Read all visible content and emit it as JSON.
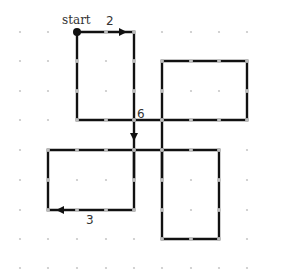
{
  "diagram": {
    "type": "grid-path",
    "colors": {
      "background": "#ffffff",
      "grid_dot": "#c8c8c8",
      "path": "#111111",
      "path_dot": "#bdbdbd",
      "label": "#333333"
    },
    "grid": {
      "columns_x": [
        20,
        48,
        77,
        106,
        134,
        162,
        191,
        219,
        247
      ],
      "rows_y": [
        32,
        61,
        91,
        120,
        150,
        180,
        210,
        239,
        268
      ]
    },
    "start_point": {
      "col": 2,
      "row": 0
    },
    "segments": [
      [
        [
          2,
          0
        ],
        [
          4,
          0
        ]
      ],
      [
        [
          2,
          0
        ],
        [
          2,
          3
        ]
      ],
      [
        [
          4,
          0
        ],
        [
          4,
          3
        ]
      ],
      [
        [
          2,
          3
        ],
        [
          4,
          3
        ]
      ],
      [
        [
          5,
          1
        ],
        [
          8,
          1
        ]
      ],
      [
        [
          5,
          1
        ],
        [
          5,
          3
        ]
      ],
      [
        [
          8,
          1
        ],
        [
          8,
          3
        ]
      ],
      [
        [
          4,
          3
        ],
        [
          8,
          3
        ]
      ],
      [
        [
          4,
          3
        ],
        [
          4,
          5
        ]
      ],
      [
        [
          5,
          3
        ],
        [
          5,
          5
        ]
      ],
      [
        [
          1,
          4
        ],
        [
          5,
          4
        ]
      ],
      [
        [
          1,
          4
        ],
        [
          1,
          6
        ]
      ],
      [
        [
          4,
          4
        ],
        [
          4,
          6
        ]
      ],
      [
        [
          1,
          6
        ],
        [
          4,
          6
        ]
      ],
      [
        [
          5,
          4
        ],
        [
          7,
          4
        ]
      ],
      [
        [
          5,
          4
        ],
        [
          5,
          7
        ]
      ],
      [
        [
          7,
          4
        ],
        [
          7,
          7
        ]
      ],
      [
        [
          5,
          7
        ],
        [
          7,
          7
        ]
      ]
    ],
    "arrows": [
      {
        "name": "arrow-right",
        "x": 123,
        "y": 32,
        "dir": "right"
      },
      {
        "name": "arrow-down",
        "x": 134,
        "y": 137,
        "dir": "down"
      },
      {
        "name": "arrow-left",
        "x": 60,
        "y": 210,
        "dir": "left"
      }
    ],
    "labels": {
      "start": "start",
      "first_step": "2",
      "middle_step": "6",
      "last_step": "3"
    }
  }
}
